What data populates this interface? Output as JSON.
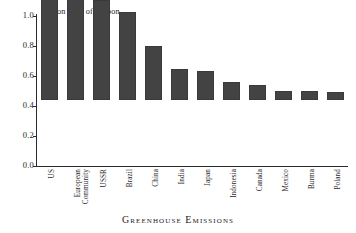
{
  "chart_data": {
    "type": "bar",
    "title": "",
    "xlabel": "Greenhouse Emissions",
    "ylabel": "",
    "annotation": "Billion Tons of Carbon",
    "units": "Billion Tons of Carbon",
    "ylim": [
      0.0,
      1.0
    ],
    "yticks": [
      "0.0",
      "0.2",
      "0.4",
      "0.6",
      "0.8",
      "1.0"
    ],
    "ytick_values": [
      0.0,
      0.2,
      0.4,
      0.6,
      0.8,
      1.0
    ],
    "grid": false,
    "legend": false,
    "bar_color": "#434343",
    "axis_color": "#2b2b2b",
    "background": "#ffffff",
    "categories": [
      "US",
      "European Community",
      "USSR",
      "Brazil",
      "China",
      "India",
      "Japan",
      "Indonesia",
      "Canada",
      "Mexico",
      "Burma",
      "Poland"
    ],
    "category_lines": [
      [
        "US"
      ],
      [
        "European",
        "Community"
      ],
      [
        "USSR"
      ],
      [
        "Brazil"
      ],
      [
        "China"
      ],
      [
        "India"
      ],
      [
        "Japan"
      ],
      [
        "Indonesia"
      ],
      [
        "Canada"
      ],
      [
        "Mexico"
      ],
      [
        "Burma"
      ],
      [
        "Poland"
      ]
    ],
    "values": [
      0.98,
      0.68,
      0.67,
      0.59,
      0.36,
      0.21,
      0.195,
      0.12,
      0.1,
      0.06,
      0.06,
      0.055
    ]
  }
}
